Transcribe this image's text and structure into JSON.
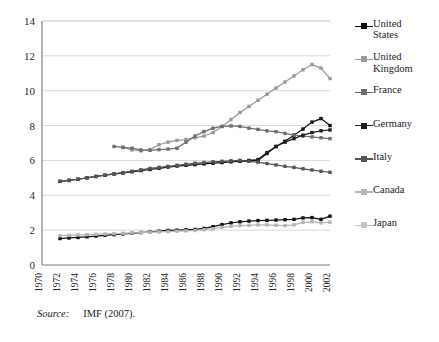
{
  "chart_data": {
    "type": "line",
    "title": "",
    "xlabel": "",
    "ylabel": "",
    "ylim": [
      0,
      14
    ],
    "ytick_step": 2,
    "yticks": [
      "0",
      "2",
      "4",
      "6",
      "8",
      "10",
      "12",
      "14"
    ],
    "grid": true,
    "legend_position": "right",
    "x": [
      1970,
      1972,
      1974,
      1976,
      1978,
      1980,
      1982,
      1984,
      1986,
      1988,
      1990,
      1992,
      1994,
      1996,
      1998,
      2000,
      2002
    ],
    "xticks": [
      "1970",
      "1972",
      "1974",
      "1976",
      "1978",
      "1980",
      "1982",
      "1984",
      "1986",
      "1988",
      "1990",
      "1992",
      "1994",
      "1996",
      "1998",
      "2000",
      "2002"
    ],
    "xtick_rotation": 90,
    "years_all": [
      1970,
      1971,
      1972,
      1973,
      1974,
      1975,
      1976,
      1977,
      1978,
      1979,
      1980,
      1981,
      1982,
      1983,
      1984,
      1985,
      1986,
      1987,
      1988,
      1989,
      1990,
      1991,
      1992,
      1993,
      1994,
      1995,
      1996,
      1997,
      1998,
      1999,
      2000,
      2001,
      2002
    ],
    "series": [
      {
        "name": "United States",
        "color": "#111111",
        "marker": "square",
        "x": [
          1972,
          1973,
          1974,
          1975,
          1976,
          1977,
          1978,
          1979,
          1980,
          1981,
          1982,
          1983,
          1984,
          1985,
          1986,
          1987,
          1988,
          1989,
          1990,
          1991,
          1992,
          1993,
          1994,
          1995,
          1996,
          1997,
          1998,
          1999,
          2000,
          2001,
          2002
        ],
        "values": [
          4.8,
          4.85,
          4.92,
          5.0,
          5.08,
          5.15,
          5.22,
          5.28,
          5.35,
          5.42,
          5.48,
          5.55,
          5.62,
          5.68,
          5.72,
          5.76,
          5.8,
          5.84,
          5.88,
          5.92,
          5.95,
          5.98,
          6.0,
          6.4,
          6.8,
          7.1,
          7.45,
          7.8,
          8.2,
          8.4,
          8.0
        ]
      },
      {
        "name": "United Kingdom",
        "color": "#9a9a9a",
        "marker": "square",
        "x": [
          1979,
          1980,
          1981,
          1982,
          1983,
          1984,
          1985,
          1986,
          1987,
          1988,
          1989,
          1990,
          1991,
          1992,
          1993,
          1994,
          1995,
          1996,
          1997,
          1998,
          1999,
          2000,
          2001,
          2002
        ],
        "values": [
          6.75,
          6.6,
          6.55,
          6.62,
          6.9,
          7.05,
          7.15,
          7.2,
          7.3,
          7.4,
          7.6,
          7.95,
          8.35,
          8.75,
          9.1,
          9.45,
          9.8,
          10.15,
          10.5,
          10.85,
          11.2,
          11.5,
          11.3,
          10.7
        ]
      },
      {
        "name": "France",
        "color": "#6e6e6e",
        "marker": "square",
        "x": [
          1978,
          1979,
          1980,
          1981,
          1982,
          1983,
          1984,
          1985,
          1986,
          1987,
          1988,
          1989,
          1990,
          1991,
          1992,
          1993,
          1994,
          1995,
          1996,
          1997,
          1998,
          1999,
          2000,
          2001,
          2002
        ],
        "values": [
          6.8,
          6.75,
          6.7,
          6.6,
          6.58,
          6.62,
          6.65,
          6.7,
          7.05,
          7.4,
          7.65,
          7.85,
          7.95,
          7.98,
          7.95,
          7.85,
          7.78,
          7.7,
          7.65,
          7.55,
          7.45,
          7.4,
          7.35,
          7.3,
          7.25
        ]
      },
      {
        "name": "Germany",
        "color": "#1f1f1f",
        "marker": "square",
        "x": [
          1992,
          1993,
          1994,
          1995,
          1996,
          1997,
          1998,
          1999,
          2000,
          2001,
          2002
        ],
        "values": [
          5.95,
          6.0,
          6.05,
          6.45,
          6.8,
          7.05,
          7.25,
          7.45,
          7.6,
          7.7,
          7.75
        ]
      },
      {
        "name": "Italy",
        "color": "#555555",
        "marker": "square",
        "x": [
          1972,
          1973,
          1974,
          1975,
          1976,
          1977,
          1978,
          1979,
          1980,
          1981,
          1982,
          1983,
          1984,
          1985,
          1986,
          1987,
          1988,
          1989,
          1990,
          1991,
          1992,
          1993,
          1994,
          1995,
          1996,
          1997,
          1998,
          1999,
          2000,
          2001,
          2002
        ],
        "values": [
          4.8,
          4.86,
          4.92,
          5.0,
          5.08,
          5.16,
          5.24,
          5.3,
          5.38,
          5.46,
          5.54,
          5.6,
          5.66,
          5.72,
          5.78,
          5.84,
          5.88,
          5.92,
          5.95,
          5.98,
          6.0,
          5.95,
          5.9,
          5.82,
          5.74,
          5.66,
          5.6,
          5.52,
          5.45,
          5.38,
          5.32
        ]
      },
      {
        "name": "Canada",
        "color": "#141414",
        "marker": "square",
        "x": [
          1972,
          1973,
          1974,
          1975,
          1976,
          1977,
          1978,
          1979,
          1980,
          1981,
          1982,
          1983,
          1984,
          1985,
          1986,
          1987,
          1988,
          1989,
          1990,
          1991,
          1992,
          1993,
          1994,
          1995,
          1996,
          1997,
          1998,
          1999,
          2000,
          2001,
          2002
        ],
        "values": [
          1.52,
          1.55,
          1.58,
          1.62,
          1.66,
          1.7,
          1.74,
          1.78,
          1.82,
          1.86,
          1.9,
          1.94,
          1.98,
          2.0,
          2.02,
          2.04,
          2.1,
          2.2,
          2.32,
          2.42,
          2.48,
          2.52,
          2.55,
          2.56,
          2.58,
          2.6,
          2.62,
          2.7,
          2.72,
          2.62,
          2.8
        ]
      },
      {
        "name": "Japan",
        "color": "#b5b5b5",
        "marker": "square",
        "x": [
          1972,
          1973,
          1974,
          1975,
          1976,
          1977,
          1978,
          1979,
          1980,
          1981,
          1982,
          1983,
          1984,
          1985,
          1986,
          1987,
          1988,
          1989,
          1990,
          1991,
          1992,
          1993,
          1994,
          1995,
          1996,
          1997,
          1998,
          1999,
          2000,
          2001,
          2002
        ],
        "values": [
          1.68,
          1.7,
          1.72,
          1.74,
          1.76,
          1.78,
          1.8,
          1.82,
          1.84,
          1.86,
          1.88,
          1.9,
          1.92,
          1.94,
          1.96,
          1.98,
          2.02,
          2.08,
          2.16,
          2.22,
          2.26,
          2.28,
          2.3,
          2.3,
          2.28,
          2.26,
          2.3,
          2.45,
          2.48,
          2.42,
          2.46
        ]
      }
    ]
  },
  "legend": {
    "items": [
      {
        "label": "United\nStates",
        "color": "#111111"
      },
      {
        "label": "United\nKingdom",
        "color": "#9a9a9a"
      },
      {
        "label": "France",
        "color": "#6e6e6e"
      },
      {
        "label": "Germany",
        "color": "#1f1f1f"
      },
      {
        "label": "Italy",
        "color": "#555555"
      },
      {
        "label": "Canada",
        "color": "#b5b5b5"
      },
      {
        "label": "Japan",
        "color": "#c4c4c4"
      }
    ]
  },
  "source": {
    "label": "Source:",
    "text": "IMF (2007)."
  },
  "colors": {
    "grid": "#d9d9d9",
    "axis": "#7a7a7a",
    "text": "#1a1a1a",
    "background": "#ffffff"
  }
}
